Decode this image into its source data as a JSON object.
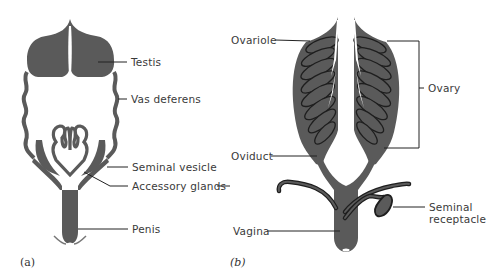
{
  "figure": {
    "colors": {
      "tissue": "#5a5a5a",
      "outline": "#1e1e1e",
      "line": "#222222",
      "background": "#ffffff"
    },
    "panel_a": {
      "tag": "(a)",
      "labels": {
        "testis": "Testis",
        "vas_deferens": "Vas deferens",
        "seminal_vesicle": "Seminal vesicle",
        "accessory_glands": "Accessory glands",
        "penis": "Penis"
      }
    },
    "panel_b": {
      "tag": "(b)",
      "labels": {
        "ovariole": "Ovariole",
        "ovary": "Ovary",
        "oviduct": "Oviduct",
        "seminal_receptacle_1": "Seminal",
        "seminal_receptacle_2": "receptacle",
        "vagina": "Vagina"
      }
    }
  }
}
